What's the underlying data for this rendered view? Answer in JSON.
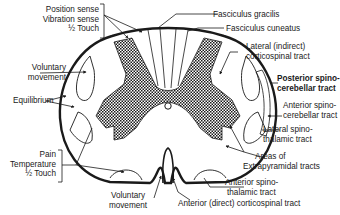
{
  "diagram": {
    "colors": {
      "line": "#1a1a1a",
      "gray_matter_fill": "#1a1a1a",
      "background": "#ffffff"
    },
    "left_labels": {
      "dorsal_sensations": [
        "Position sense",
        "Vibration sense",
        "½ Touch"
      ],
      "voluntary_movement": [
        "Voluntary",
        "movement"
      ],
      "equilibrium": "Equilibrium",
      "pain_group": [
        "Pain",
        "Temperature",
        "½ Touch"
      ]
    },
    "bottom_labels": {
      "voluntary_movement": [
        "Voluntary",
        "movement"
      ],
      "anterior_corticospinal": "Anterior (direct) corticospinal tract"
    },
    "right_labels": {
      "fasciculus_gracilis": "Fasciculus gracilis",
      "fasciculus_cuneatus": "Fasciculus cuneatus",
      "lateral_corticospinal": [
        "Lateral (indirect)",
        "corticospinal tract"
      ],
      "posterior_spinocerebellar": [
        "Posterior spino-",
        "cerebellar tract"
      ],
      "anterior_spinocerebellar": [
        "Anterior spino-",
        "cerebellar tract"
      ],
      "lateral_spinothalamic": [
        "Lateral spino-",
        "thalamic tract"
      ],
      "extrapyramidal": [
        "Areas of",
        "Extrapyramidal tracts"
      ],
      "anterior_spinothalamic": [
        "Anterior spino-",
        "thalamic tract"
      ]
    }
  }
}
